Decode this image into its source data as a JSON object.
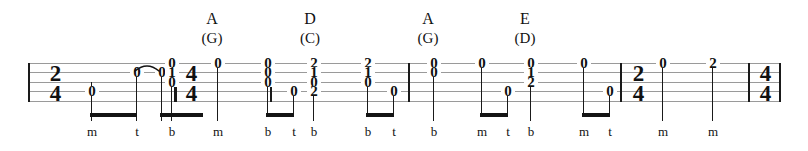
{
  "sheet": {
    "title": "banjo-tablature-excerpt",
    "staff_lines": 5,
    "ink_color": "#111111",
    "staff_line_color": "#9a9a9a"
  },
  "time_signatures": [
    {
      "name": "time-sig-2-4-opening",
      "numerator": "2",
      "denominator": "4",
      "x": 44
    },
    {
      "name": "time-sig-4-4-main",
      "numerator": "4",
      "denominator": "4",
      "x": 180
    },
    {
      "name": "time-sig-2-4-ending",
      "numerator": "2",
      "denominator": "4",
      "x": 627
    },
    {
      "name": "time-sig-4-4-final",
      "numerator": "4",
      "denominator": "4",
      "x": 754
    }
  ],
  "barlines": [
    {
      "name": "barline-opening",
      "x": 28,
      "thick": false
    },
    {
      "name": "barline-pickup-end",
      "x": 174,
      "thick": true
    },
    {
      "name": "barline-m1-end",
      "x": 270,
      "thick": false
    },
    {
      "name": "barline-m2-end",
      "x": 408,
      "thick": false
    },
    {
      "name": "barline-m3-end",
      "x": 620,
      "thick": false
    },
    {
      "name": "barline-m4-end",
      "x": 748,
      "thick": false
    },
    {
      "name": "barline-final",
      "x": 779,
      "thick": false
    }
  ],
  "chords": [
    {
      "name": "chord-a-g",
      "main": "A",
      "alt": "(G)",
      "x": 212
    },
    {
      "name": "chord-d-c",
      "main": "D",
      "alt": "(C)",
      "x": 310
    },
    {
      "name": "chord-a-g-2",
      "main": "A",
      "alt": "(G)",
      "x": 428
    },
    {
      "name": "chord-e-d",
      "main": "E",
      "alt": "(D)",
      "x": 525
    }
  ],
  "notes": [
    {
      "name": "note-pickup-1",
      "x": 86,
      "frets": [
        {
          "value": "0",
          "string": 3
        }
      ],
      "stem": {
        "top": 82,
        "bottom": 121
      },
      "fingering": "m"
    },
    {
      "name": "note-pickup-2",
      "x": 131,
      "frets": [
        {
          "value": "0",
          "string": 1
        }
      ],
      "stem": {
        "top": 72,
        "bottom": 121
      },
      "fingering": "t"
    },
    {
      "name": "note-pickup-3",
      "x": 156,
      "frets": [
        {
          "value": "0",
          "string": 1
        }
      ],
      "stem": {
        "top": 72,
        "bottom": 121
      },
      "fingering": null
    },
    {
      "name": "note-pickup-4",
      "x": 166,
      "frets": [
        {
          "value": "0",
          "string": 0
        },
        {
          "value": "1",
          "string": 1
        },
        {
          "value": "0",
          "string": 2
        }
      ],
      "stem": {
        "top": 82,
        "bottom": 121
      },
      "fingering": "b"
    },
    {
      "name": "note-m1-1",
      "x": 212,
      "frets": [
        {
          "value": "0",
          "string": 0
        }
      ],
      "stem": {
        "top": 63,
        "bottom": 121
      },
      "fingering": "m"
    },
    {
      "name": "note-m1-2",
      "x": 262,
      "frets": [
        {
          "value": "0",
          "string": 0
        },
        {
          "value": "0",
          "string": 1
        },
        {
          "value": "0",
          "string": 2
        }
      ],
      "stem": {
        "top": 82,
        "bottom": 115
      },
      "fingering": "b"
    },
    {
      "name": "note-m1-3",
      "x": 288,
      "frets": [
        {
          "value": "0",
          "string": 3
        }
      ],
      "stem": {
        "top": 96,
        "bottom": 115
      },
      "fingering": "t"
    },
    {
      "name": "note-m2-1",
      "x": 308,
      "frets": [
        {
          "value": "2",
          "string": 0
        },
        {
          "value": "1",
          "string": 1
        },
        {
          "value": "0",
          "string": 2
        },
        {
          "value": "2",
          "string": 3
        }
      ],
      "stem": {
        "top": 96,
        "bottom": 121
      },
      "fingering": "b"
    },
    {
      "name": "note-m2-2",
      "x": 362,
      "frets": [
        {
          "value": "2",
          "string": 0
        },
        {
          "value": "1",
          "string": 1
        },
        {
          "value": "0",
          "string": 2
        }
      ],
      "stem": {
        "top": 82,
        "bottom": 115
      },
      "fingering": "b"
    },
    {
      "name": "note-m2-3",
      "x": 388,
      "frets": [
        {
          "value": "0",
          "string": 3
        }
      ],
      "stem": {
        "top": 96,
        "bottom": 115
      },
      "fingering": "t"
    },
    {
      "name": "note-m3-1",
      "x": 428,
      "frets": [
        {
          "value": "0",
          "string": 0
        },
        {
          "value": "0",
          "string": 1
        }
      ],
      "stem": {
        "top": 72,
        "bottom": 121
      },
      "fingering": "b"
    },
    {
      "name": "note-m3-2",
      "x": 476,
      "frets": [
        {
          "value": "0",
          "string": 0
        }
      ],
      "stem": {
        "top": 63,
        "bottom": 115
      },
      "fingering": "m"
    },
    {
      "name": "note-m3-3",
      "x": 502,
      "frets": [
        {
          "value": "0",
          "string": 3
        }
      ],
      "stem": {
        "top": 96,
        "bottom": 115
      },
      "fingering": "t"
    },
    {
      "name": "note-m4-1",
      "x": 525,
      "frets": [
        {
          "value": "0",
          "string": 0
        },
        {
          "value": "1",
          "string": 1
        },
        {
          "value": "2",
          "string": 2
        }
      ],
      "stem": {
        "top": 82,
        "bottom": 121
      },
      "fingering": "b"
    },
    {
      "name": "note-m4-2",
      "x": 578,
      "frets": [
        {
          "value": "0",
          "string": 0
        }
      ],
      "stem": {
        "top": 63,
        "bottom": 115
      },
      "fingering": "m"
    },
    {
      "name": "note-m4-3",
      "x": 604,
      "frets": [
        {
          "value": "0",
          "string": 3
        }
      ],
      "stem": {
        "top": 96,
        "bottom": 115
      },
      "fingering": "t"
    },
    {
      "name": "note-m5-1",
      "x": 657,
      "frets": [
        {
          "value": "0",
          "string": 0
        }
      ],
      "stem": {
        "top": 63,
        "bottom": 121
      },
      "fingering": "m"
    },
    {
      "name": "note-m5-2",
      "x": 707,
      "frets": [
        {
          "value": "2",
          "string": 0
        }
      ],
      "stem": {
        "top": 63,
        "bottom": 121
      },
      "fingering": "m"
    }
  ],
  "beams": [
    {
      "name": "beam-pickup-1",
      "x": 85,
      "width": 47
    },
    {
      "name": "beam-pickup-2",
      "x": 155,
      "width": 43
    },
    {
      "name": "beam-m1",
      "x": 261,
      "width": 28
    },
    {
      "name": "beam-m2",
      "x": 361,
      "width": 28
    },
    {
      "name": "beam-m3",
      "x": 475,
      "width": 28
    },
    {
      "name": "beam-m4",
      "x": 577,
      "width": 28
    }
  ],
  "ties": [
    {
      "name": "tie-pickup",
      "x": 133,
      "y": 60,
      "width": 24
    }
  ],
  "fingerings": [
    {
      "name": "fingering-1",
      "label": "m",
      "x": 86
    },
    {
      "name": "fingering-2",
      "label": "t",
      "x": 131
    },
    {
      "name": "fingering-3",
      "label": "b",
      "x": 166
    },
    {
      "name": "fingering-4",
      "label": "m",
      "x": 212
    },
    {
      "name": "fingering-5",
      "label": "b",
      "x": 262
    },
    {
      "name": "fingering-6",
      "label": "t",
      "x": 288
    },
    {
      "name": "fingering-7",
      "label": "b",
      "x": 308
    },
    {
      "name": "fingering-8",
      "label": "b",
      "x": 362
    },
    {
      "name": "fingering-9",
      "label": "t",
      "x": 388
    },
    {
      "name": "fingering-10",
      "label": "b",
      "x": 428
    },
    {
      "name": "fingering-11",
      "label": "m",
      "x": 476
    },
    {
      "name": "fingering-12",
      "label": "t",
      "x": 502
    },
    {
      "name": "fingering-13",
      "label": "b",
      "x": 525
    },
    {
      "name": "fingering-14",
      "label": "m",
      "x": 578
    },
    {
      "name": "fingering-15",
      "label": "t",
      "x": 604
    },
    {
      "name": "fingering-16",
      "label": "m",
      "x": 657
    },
    {
      "name": "fingering-17",
      "label": "m",
      "x": 707
    }
  ]
}
